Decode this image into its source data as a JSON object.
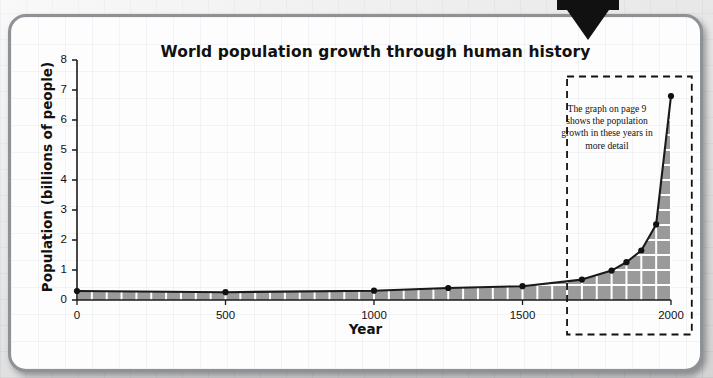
{
  "figure": {
    "arrow_icon": "down-arrow-callout",
    "card_label": "chart-card"
  },
  "annotation": {
    "text": "The graph on page 9 shows the population growth in these years in more detail",
    "box": {
      "x0": 1650,
      "x1": 2070,
      "y0": -1.15,
      "y1": 7.45
    }
  },
  "chart_data": {
    "type": "area",
    "title": "World population growth through human history",
    "xlabel": "Year",
    "ylabel": "Population (billions of people)",
    "xlim": [
      0,
      2000
    ],
    "ylim": [
      0,
      8
    ],
    "xticks": [
      0,
      500,
      1000,
      1500,
      2000
    ],
    "xtick_labels": [
      "0",
      "500",
      "1000",
      "1500",
      "2000"
    ],
    "yticks": [
      0,
      1,
      2,
      3,
      4,
      5,
      6,
      7,
      8
    ],
    "ytick_labels": [
      "0",
      "1",
      "2",
      "3",
      "4",
      "5",
      "6",
      "7",
      "8"
    ],
    "grid": "white gridlines inside shaded area only",
    "legend": "none",
    "series": [
      {
        "name": "World population",
        "marker": "filled circle",
        "line_color": "#1a1a1a",
        "fill_color": "#9a9a9a",
        "x": [
          0,
          500,
          1000,
          1250,
          1500,
          1700,
          1800,
          1850,
          1900,
          1950,
          2000
        ],
        "y": [
          0.3,
          0.26,
          0.31,
          0.4,
          0.46,
          0.68,
          0.98,
          1.26,
          1.65,
          2.52,
          6.8
        ]
      }
    ]
  },
  "colors": {
    "fill": "#9a9a9a",
    "line": "#1a1a1a",
    "grid_inside": "#ffffff",
    "card_border": "#8e9296",
    "page_bg": "#f2f2f2"
  }
}
